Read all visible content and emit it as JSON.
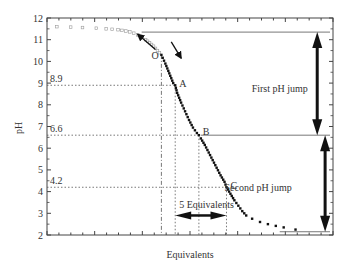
{
  "chart_data": {
    "type": "scatter",
    "title": "",
    "xlabel": "Equivalents",
    "ylabel": "pH",
    "ylim": [
      2,
      12
    ],
    "yticks": [
      2,
      3,
      4,
      5,
      6,
      7,
      8,
      9,
      10,
      11,
      12
    ],
    "grid": false,
    "x_tick_labels": [],
    "series": [
      {
        "name": "reverse titration (open squares, back from O)",
        "marker": "open-square",
        "points": [
          [
            5,
            11.6
          ],
          [
            12,
            11.58
          ],
          [
            18,
            11.56
          ],
          [
            25,
            11.53
          ],
          [
            30,
            11.5
          ],
          [
            33,
            11.48
          ],
          [
            36,
            11.46
          ],
          [
            38,
            11.43
          ],
          [
            40,
            11.4
          ],
          [
            42,
            11.36
          ],
          [
            44,
            11.3
          ],
          [
            46,
            11.22
          ],
          [
            48,
            11.12
          ],
          [
            50,
            11.0
          ],
          [
            52,
            10.86
          ],
          [
            54,
            10.7
          ],
          [
            56,
            10.5
          ],
          [
            58,
            10.3
          ]
        ]
      },
      {
        "name": "forward titration (filled squares, from O)",
        "marker": "filled-square",
        "points": [
          [
            58,
            10.3
          ],
          [
            60,
            9.9
          ],
          [
            62,
            9.45
          ],
          [
            64,
            9.0
          ],
          [
            65,
            8.9
          ],
          [
            66,
            8.55
          ],
          [
            68,
            8.1
          ],
          [
            70,
            7.7
          ],
          [
            72,
            7.3
          ],
          [
            74,
            6.95
          ],
          [
            76,
            6.7
          ],
          [
            77,
            6.6
          ],
          [
            78,
            6.45
          ],
          [
            80,
            6.15
          ],
          [
            82,
            5.8
          ],
          [
            84,
            5.45
          ],
          [
            86,
            5.1
          ],
          [
            88,
            4.75
          ],
          [
            90,
            4.45
          ],
          [
            91,
            4.2
          ],
          [
            93,
            3.9
          ],
          [
            95,
            3.6
          ],
          [
            97,
            3.35
          ],
          [
            99,
            3.1
          ],
          [
            101,
            2.9
          ],
          [
            104,
            2.75
          ],
          [
            108,
            2.6
          ],
          [
            112,
            2.5
          ],
          [
            116,
            2.42
          ],
          [
            120,
            2.35
          ],
          [
            126,
            2.25
          ],
          [
            132,
            2.2
          ]
        ]
      }
    ],
    "reference_lines": {
      "horizontal_dotted": [
        {
          "label": "8.9",
          "y": 8.9
        },
        {
          "label": "6.6",
          "y": 6.6
        },
        {
          "label": "4.2",
          "y": 4.2
        }
      ],
      "horizontal_solid": [
        {
          "y": 11.35,
          "from_x": 48
        },
        {
          "y": 6.6,
          "from_x": 78
        },
        {
          "y": 2.15,
          "from_x": 118
        }
      ],
      "vertical": [
        {
          "point": "O",
          "x": 58,
          "style": "dash-dot"
        },
        {
          "point": "A",
          "x": 65,
          "style": "dotted"
        },
        {
          "point": "B",
          "x": 77,
          "style": "dotted"
        },
        {
          "point": "C",
          "x": 91,
          "style": "dotted"
        }
      ]
    },
    "annotations": [
      {
        "text": "O",
        "x": 53,
        "y": 10.25
      },
      {
        "text": "A",
        "x": 67,
        "y": 9.0
      },
      {
        "text": "B",
        "x": 79,
        "y": 6.75
      },
      {
        "text": "C",
        "x": 93,
        "y": 4.3
      },
      {
        "text": "First pH jump",
        "x": 118,
        "y": 8.75
      },
      {
        "text": "Second pH jump",
        "x": 107,
        "y": 4.2
      },
      {
        "text": "5 Equivalents",
        "x": 67,
        "y": 3.4
      }
    ],
    "arrows": [
      {
        "name": "first-ph-jump",
        "type": "double",
        "x": 137,
        "y_from": 11.35,
        "y_to": 6.6
      },
      {
        "name": "second-ph-jump",
        "type": "double",
        "x": 141,
        "y_from": 6.6,
        "y_to": 2.15
      },
      {
        "name": "five-equivalents",
        "type": "double",
        "y": 2.9,
        "x_from": 65,
        "x_to": 91
      },
      {
        "name": "reverse-direction",
        "type": "single",
        "from": [
          55,
          10.55
        ],
        "to": [
          46,
          11.25
        ]
      },
      {
        "name": "forward-direction",
        "type": "single",
        "from": [
          63,
          10.9
        ],
        "to": [
          68,
          10.15
        ]
      }
    ],
    "xlim": [
      0,
      145
    ]
  }
}
